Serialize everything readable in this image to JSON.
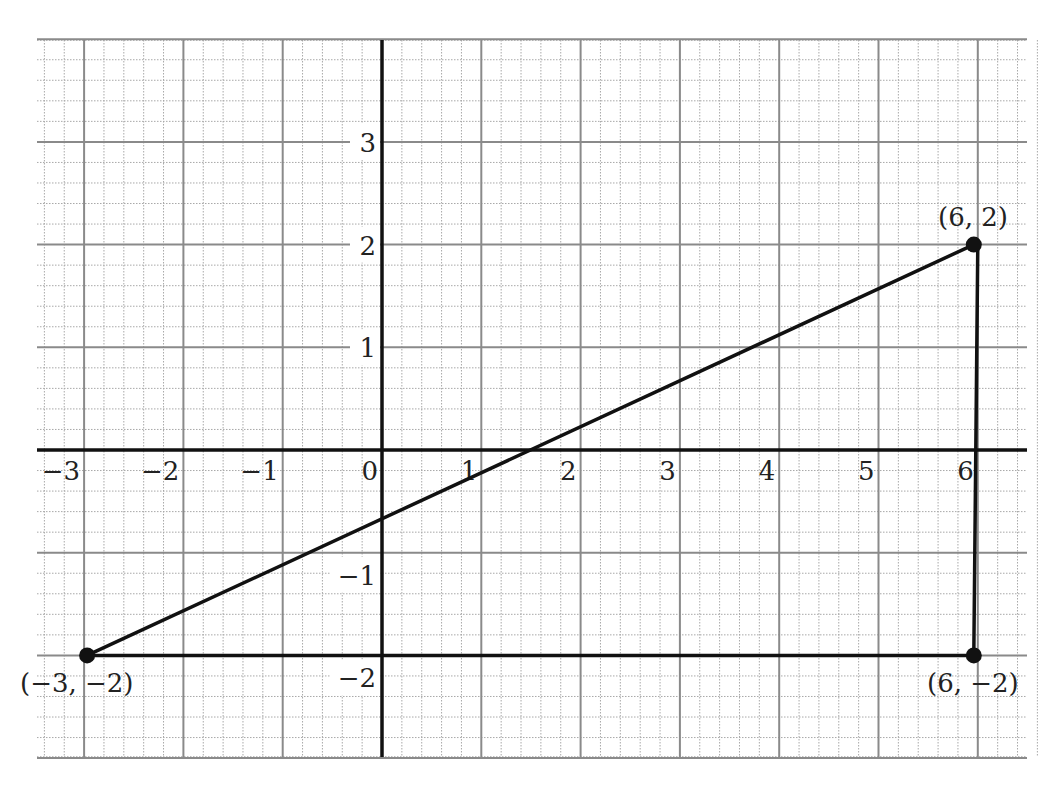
{
  "figure": {
    "type": "coordinate-plane"
  },
  "axes": {
    "x": {
      "range": [
        -3.5,
        6.5
      ],
      "tick_labels": [
        "−3",
        "−2",
        "−1",
        "0",
        "1",
        "2",
        "3",
        "4",
        "5",
        "6"
      ],
      "tick_values": [
        -3,
        -2,
        -1,
        0,
        1,
        2,
        3,
        4,
        5,
        6
      ]
    },
    "y": {
      "range": [
        -3,
        4
      ],
      "tick_labels": [
        "3",
        "2",
        "1",
        "−1",
        "−2"
      ],
      "tick_values": [
        3,
        2,
        1,
        -1,
        -2
      ]
    }
  },
  "grid": {
    "major_step": 1,
    "minor_step": 0.2,
    "major_color": "#8a8a8a",
    "minor_color": "#a8a8a8",
    "axis_color": "#111111"
  },
  "points": [
    {
      "x": -3,
      "y": -2,
      "label": "(−3, −2)"
    },
    {
      "x": 6,
      "y": 2,
      "label": "(6, 2)"
    },
    {
      "x": 6,
      "y": -2,
      "label": "(6, −2)"
    }
  ],
  "segments": [
    {
      "from": [
        -3,
        -2
      ],
      "to": [
        6,
        2
      ]
    },
    {
      "from": [
        6,
        2
      ],
      "to": [
        6,
        -2
      ]
    },
    {
      "from": [
        -3,
        -2
      ],
      "to": [
        6,
        -2
      ]
    }
  ],
  "labels": {
    "p1": "(−3, −2)",
    "p2": "(6, 2)",
    "p3": "(6, −2)",
    "x_ticks": [
      "−3",
      "−2",
      "−1",
      "0",
      "1",
      "2",
      "3",
      "4",
      "5",
      "6"
    ],
    "y_ticks": [
      "3",
      "2",
      "1",
      "−1",
      "−2"
    ]
  }
}
